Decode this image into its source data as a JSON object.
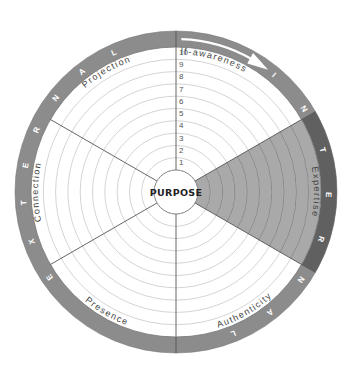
{
  "diagram": {
    "center_label": "PURPOSE",
    "scale": [
      "1",
      "2",
      "3",
      "4",
      "5",
      "6",
      "7",
      "8",
      "9",
      "10"
    ],
    "sectors": [
      {
        "label": "Self-awareness",
        "start": 0,
        "end": 60,
        "shaded": false
      },
      {
        "label": "Expertise",
        "start": 60,
        "end": 120,
        "shaded": true
      },
      {
        "label": "Authenticity",
        "start": 120,
        "end": 180,
        "shaded": false
      },
      {
        "label": "Presence",
        "start": 180,
        "end": 240,
        "shaded": false
      },
      {
        "label": "Connection",
        "start": 240,
        "end": 300,
        "shaded": false
      },
      {
        "label": "Projection",
        "start": 300,
        "end": 360,
        "shaded": false
      }
    ],
    "band": {
      "internal_word": "INTERNAL",
      "external_word": "EXTERNAL",
      "internal_letter_angles": [
        40,
        57,
        74,
        91,
        108,
        125,
        142,
        158
      ],
      "external_letter_angles": [
        236,
        251,
        266,
        280,
        294,
        308,
        322,
        336
      ],
      "dark_segment": {
        "start": 60,
        "end": 120
      }
    },
    "colors": {
      "band": "#8c8c8c",
      "band_dark": "#606060",
      "shaded_sector": "#a9a9a9",
      "ring_line": "#c9c9c9",
      "divider": "#555555"
    }
  }
}
